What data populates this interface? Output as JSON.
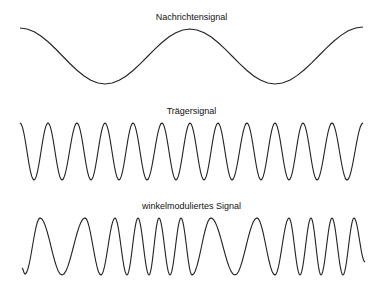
{
  "panels": [
    {
      "id": "message",
      "title": "Nachrichtensignal",
      "title_y": 12
    },
    {
      "id": "carrier",
      "title": "Trägersignal",
      "title_y": 106
    },
    {
      "id": "modulated",
      "title": "winkelmoduliertes Signal",
      "title_y": 201
    }
  ],
  "waveforms": {
    "message": {
      "x_start": 20,
      "x_end": 363,
      "y_top": 28,
      "y_bottom": 84,
      "extrema": [
        [
          20,
          28
        ],
        [
          105,
          84
        ],
        [
          190,
          29
        ],
        [
          275,
          84
        ],
        [
          363,
          27
        ]
      ]
    },
    "carrier": {
      "x_start": 20,
      "x_end": 363,
      "y_top": 123,
      "y_bottom": 180,
      "extrema": [
        [
          20,
          123
        ],
        [
          34,
          180
        ],
        [
          48,
          123
        ],
        [
          62,
          180
        ],
        [
          77,
          123
        ],
        [
          91,
          180
        ],
        [
          105,
          123
        ],
        [
          119,
          180
        ],
        [
          133,
          123
        ],
        [
          147,
          180
        ],
        [
          162,
          123
        ],
        [
          176,
          180
        ],
        [
          190,
          123
        ],
        [
          204,
          180
        ],
        [
          218,
          123
        ],
        [
          232,
          180
        ],
        [
          247,
          123
        ],
        [
          261,
          180
        ],
        [
          275,
          123
        ],
        [
          289,
          180
        ],
        [
          303,
          123
        ],
        [
          317,
          180
        ],
        [
          332,
          123
        ],
        [
          347,
          180
        ],
        [
          363,
          123
        ]
      ]
    },
    "modulated": {
      "x_start": 22,
      "x_end": 365,
      "y_top": 218,
      "y_bottom": 275,
      "extrema": [
        [
          22,
          268
        ],
        [
          25,
          274
        ],
        [
          40,
          218
        ],
        [
          62,
          275
        ],
        [
          85,
          218
        ],
        [
          101,
          275
        ],
        [
          115,
          218
        ],
        [
          127,
          275
        ],
        [
          138,
          218
        ],
        [
          149,
          275
        ],
        [
          159,
          218
        ],
        [
          170,
          275
        ],
        [
          181,
          218
        ],
        [
          192,
          275
        ],
        [
          211,
          218
        ],
        [
          235,
          275
        ],
        [
          257,
          218
        ],
        [
          275,
          275
        ],
        [
          289,
          218
        ],
        [
          300,
          275
        ],
        [
          311,
          218
        ],
        [
          321,
          275
        ],
        [
          332,
          218
        ],
        [
          343,
          275
        ],
        [
          354,
          218
        ],
        [
          365,
          262
        ]
      ]
    }
  },
  "colors": {
    "stroke": "#222222",
    "background": "#ffffff",
    "text": "#111111"
  }
}
